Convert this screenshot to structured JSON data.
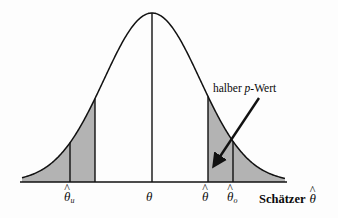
{
  "figure": {
    "annotation": {
      "text_before": "halber ",
      "italic_symbol": "p",
      "text_after": "-Wert"
    },
    "axis_title": {
      "label": "Schätzer",
      "symbol": "θ",
      "hat": "^"
    },
    "tick_labels": [
      {
        "name": "theta-hat-lower",
        "symbol": "θ",
        "hat": "^",
        "subscript": "u",
        "x": 70
      },
      {
        "name": "theta",
        "symbol": "θ",
        "hat": "",
        "subscript": "",
        "x": 152
      },
      {
        "name": "theta-hat",
        "symbol": "θ",
        "hat": "^",
        "subscript": "",
        "x": 208
      },
      {
        "name": "theta-hat-upper",
        "symbol": "θ",
        "hat": "^",
        "subscript": "o",
        "x": 233
      }
    ],
    "colors": {
      "shade": "#b3b3b3",
      "curve": "#111111",
      "axis": "#111111",
      "background": "#fdfdfd",
      "text": "#0a0a0a"
    }
  },
  "chart_data": {
    "type": "area",
    "title": "",
    "subtitle": "",
    "xlabel": "Schätzer θ̂",
    "ylabel": "",
    "grid": false,
    "legend_position": "none",
    "distribution": "normal",
    "mean_label": "θ",
    "mean_x": 152,
    "peak_y": 13,
    "baseline_y": 182,
    "axis_x_start": 20,
    "axis_x_end": 287,
    "curve_left_end": 22,
    "curve_right_end": 285,
    "sigma_px": 48,
    "vertical_lines": [
      {
        "label": "θ̂u",
        "x": 70,
        "role": "lower-confidence-bound"
      },
      {
        "label": "inner-left",
        "x": 95,
        "role": "left-shade-edge"
      },
      {
        "label": "θ",
        "x": 152,
        "role": "center-mean"
      },
      {
        "label": "θ̂",
        "x": 208,
        "role": "estimate"
      },
      {
        "label": "θ̂o",
        "x": 233,
        "role": "upper-confidence-bound"
      }
    ],
    "shaded_regions": [
      {
        "name": "left-tail-half-p-value",
        "x_from": 22,
        "x_to": 95,
        "color": "#b3b3b3"
      },
      {
        "name": "right-tail-half-p-value",
        "x_from": 208,
        "x_to": 285,
        "color": "#b3b3b3"
      }
    ],
    "annotations": [
      {
        "text": "halber p-Wert",
        "text_x": 213,
        "text_y": 83,
        "arrow_from_x": 259,
        "arrow_from_y": 98,
        "arrow_to_x": 219,
        "arrow_to_y": 158
      }
    ]
  }
}
